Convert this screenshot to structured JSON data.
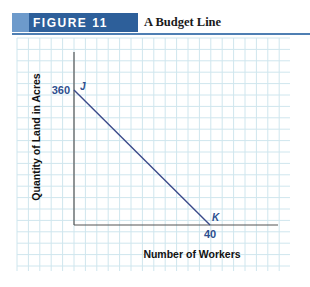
{
  "figure": {
    "label": "FIGURE 11",
    "title": "A Budget Line"
  },
  "colors": {
    "label_bg": "#2d5f9a",
    "label_accent": "#6d9acb",
    "rule": "#4f7fb3",
    "grid": "#cfe6ee",
    "line": "#3b4a8a",
    "point_text": "#2d4f8f"
  },
  "chart_data": {
    "type": "line",
    "title": "A Budget Line",
    "xlabel": "Number of Workers",
    "ylabel": "Quantity of Land in Acres",
    "series": [
      {
        "name": "Budget line",
        "points": [
          {
            "label": "J",
            "x": 0,
            "y": 360
          },
          {
            "label": "K",
            "x": 40,
            "y": 0
          }
        ]
      }
    ],
    "x_ticks": [
      "40"
    ],
    "y_ticks": [
      "360"
    ],
    "xlim": [
      0,
      55
    ],
    "ylim": [
      0,
      450
    ],
    "grid": true
  }
}
